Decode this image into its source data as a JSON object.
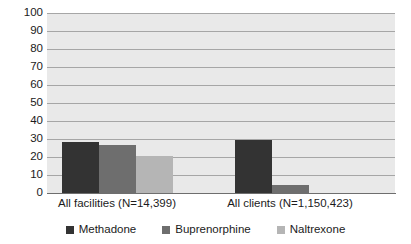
{
  "chart_data": {
    "type": "bar",
    "title": "",
    "subtitle": "",
    "xlabel": "",
    "ylabel": "",
    "ylim": [
      0,
      100
    ],
    "ytick_step": 10,
    "yticks": [
      "100",
      "90",
      "80",
      "70",
      "60",
      "50",
      "40",
      "30",
      "20",
      "10",
      "0"
    ],
    "grid": true,
    "legend_position": "bottom",
    "categories": [
      "All facilities (N=14,399)",
      "All clients (N=1,150,423)"
    ],
    "series": [
      {
        "name": "Methadone",
        "color": "#333333",
        "values": [
          29,
          30
        ]
      },
      {
        "name": "Buprenorphine",
        "color": "#6e6e6e",
        "values": [
          27,
          5
        ]
      },
      {
        "name": "Naltrexone",
        "color": "#b5b5b5",
        "values": [
          21,
          0
        ]
      }
    ]
  },
  "colors": {
    "plot_background": "#e9e9e9",
    "gridline": "#a6a6a6",
    "axis": "#6e6e6e",
    "text": "#1b1b1b",
    "methadone": "#333333",
    "buprenorphine": "#6e6e6e",
    "naltrexone": "#b5b5b5"
  }
}
